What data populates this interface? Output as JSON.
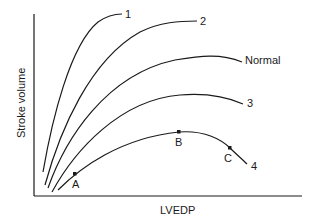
{
  "diagram": {
    "x_axis_label": "LVEDP",
    "y_axis_label": "Stroke volume",
    "curves": [
      {
        "label": "1"
      },
      {
        "label": "2"
      },
      {
        "label": "Normal"
      },
      {
        "label": "3"
      },
      {
        "label": "4"
      }
    ],
    "points": [
      {
        "label": "A",
        "curve": "4"
      },
      {
        "label": "B",
        "curve": "4"
      },
      {
        "label": "C",
        "curve": "4"
      }
    ]
  }
}
